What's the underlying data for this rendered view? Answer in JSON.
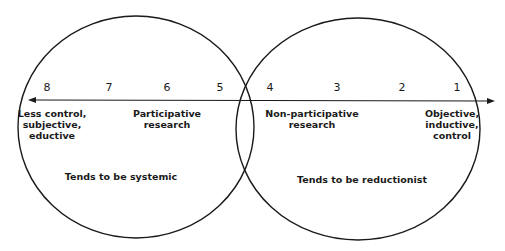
{
  "diagram": {
    "type": "venn-continuum",
    "left_circle": {
      "label": "Tends to be systemic"
    },
    "right_circle": {
      "label": "Tends to be reductionist"
    },
    "axis": {
      "direction": "bidirectional",
      "ticks": [
        "8",
        "7",
        "6",
        "5",
        "4",
        "3",
        "2",
        "1"
      ]
    },
    "annotations": {
      "left_end": [
        "Less control,",
        "subjective,",
        "eductive"
      ],
      "participative": [
        "Participative",
        "research"
      ],
      "non_participative": [
        "Non-participative",
        "research"
      ],
      "right_end": [
        "Objective,",
        "inductive,",
        "control"
      ]
    },
    "colors": {
      "stroke": "#1a1a1a",
      "background": "#ffffff"
    }
  }
}
